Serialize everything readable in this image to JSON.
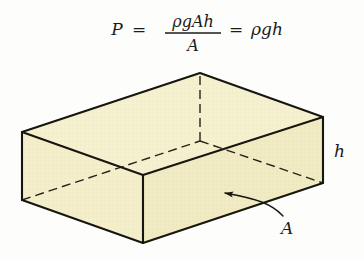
{
  "figure": {
    "background_color": "#fdfdfb",
    "equation": {
      "lhs": "P",
      "equals_1": "=",
      "numerator": "ρgAh",
      "denominator": "A",
      "equals_2": "=",
      "rhs": "ρgh",
      "full_text": "P = ρgAh / A = ρgh"
    },
    "labels": {
      "height_label": "h",
      "area_label": "A"
    },
    "box": {
      "fill_color": "#f3eec9",
      "fill_color_top": "#f4f0d0",
      "fill_color_front": "#efe9c0",
      "edge_color": "#17150f",
      "hidden_edge_style": "dashed",
      "shape": "rectangular prism",
      "visible_faces": [
        "top",
        "left",
        "front"
      ]
    },
    "annotations": {
      "arrow_target": "front face of block",
      "arrow_label": "A"
    }
  }
}
